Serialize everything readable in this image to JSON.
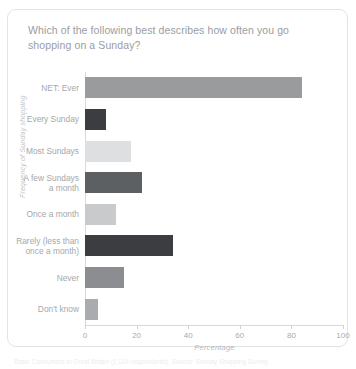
{
  "card": {
    "title": "Which of the following best describes how often you go shopping on a Sunday?"
  },
  "footnote": {
    "text": "Base: Consumers in Great Britain (1,014 respondents). Source: Sunday Shopping Survey."
  },
  "chart_data": {
    "type": "bar",
    "orientation": "horizontal",
    "title": "Which of the following best describes how often you go shopping on a Sunday?",
    "xlabel": "Percentage",
    "ylabel": "Frequency of Sunday shopping",
    "xlim": [
      0,
      100
    ],
    "xticks": [
      0,
      20,
      40,
      60,
      80,
      100
    ],
    "grid": false,
    "legend": "none",
    "categories": [
      "NET: Ever",
      "Every Sunday",
      "Most Sundays",
      "A few Sundays\na month",
      "Once a month",
      "Rarely (less than\nonce a month)",
      "Never",
      "Don't know"
    ],
    "values": [
      84,
      8,
      18,
      22,
      12,
      34,
      15,
      5
    ],
    "colors": [
      "#999b9d",
      "#3b3d40",
      "#dedfe1",
      "#5d6063",
      "#c8cacc",
      "#3b3d40",
      "#8b8d90",
      "#a9abae"
    ]
  }
}
